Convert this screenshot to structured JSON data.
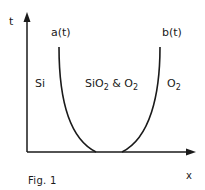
{
  "figure": {
    "caption": "Fig. 1",
    "axes": {
      "x_label": "x",
      "y_label": "t"
    },
    "curves": [
      {
        "label": "a(t)"
      },
      {
        "label": "b(t)"
      }
    ],
    "regions": {
      "left": {
        "text": "Si"
      },
      "middle": {
        "main": "SiO",
        "sub1": "2",
        "amp": " & O",
        "sub2": "2"
      },
      "right": {
        "main": "O",
        "sub": "2"
      }
    },
    "colors": {
      "stroke": "#1a1a1a",
      "background": "#ffffff"
    }
  }
}
